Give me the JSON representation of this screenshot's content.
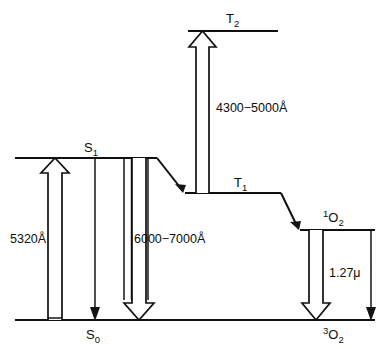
{
  "diagram": {
    "type": "energy-level-diagram",
    "background_color": "#ffffff",
    "line_color": "#101010",
    "levels": [
      {
        "id": "S1",
        "label_main": "S",
        "label_sub": "1",
        "label_sup": "",
        "label_text": "S1",
        "x1": 15,
        "x2": 157,
        "y": 158,
        "label_x": 90,
        "label_y": 151
      },
      {
        "id": "S0",
        "label_main": "S",
        "label_sub": "0",
        "label_sup": "",
        "label_text": "S0",
        "x1": 15,
        "x2": 375,
        "y": 320,
        "label_x": 92,
        "label_y": 337
      },
      {
        "id": "T2",
        "label_main": "T",
        "label_sub": "2",
        "label_sup": "",
        "label_text": "T2",
        "x1": 188,
        "x2": 278,
        "y": 31,
        "label_x": 232,
        "label_y": 22
      },
      {
        "id": "T1",
        "label_main": "T",
        "label_sub": "1",
        "label_sup": "",
        "label_text": "T1",
        "x1": 185,
        "x2": 281,
        "y": 193,
        "label_x": 240,
        "label_y": 186
      },
      {
        "id": "O2-singlet",
        "label_main": "O",
        "label_sub": "2",
        "label_sup": "1",
        "label_text": "1O2",
        "x1": 300,
        "x2": 375,
        "y": 230,
        "label_x": 331,
        "label_y": 221
      },
      {
        "id": "O2-triplet",
        "label_main": "O",
        "label_sub": "2",
        "label_sup": "3",
        "label_text": "3O2",
        "x1": 300,
        "x2": 375,
        "y": 320,
        "label_x": 331,
        "label_y": 338
      }
    ],
    "transitions": [
      {
        "id": "absorption",
        "name": "absorption-5320",
        "style": "hollow-arrow",
        "direction": "up",
        "label": "5320Å",
        "label_x": 10,
        "label_y": 238,
        "from_y": 320,
        "to_y": 158,
        "center_x": 55
      },
      {
        "id": "fluorescence-thin",
        "name": "fluorescence-thin-arrow",
        "style": "thin-arrow",
        "direction": "down",
        "label": "",
        "from_y": 158,
        "to_y": 320,
        "center_x": 95
      },
      {
        "id": "fluorescence",
        "name": "fluorescence-6000-7000",
        "style": "hollow-arrow",
        "direction": "down",
        "label": "6000−7000Å",
        "label_x": 131,
        "label_y": 238,
        "from_y": 158,
        "to_y": 320,
        "center_x": 139
      },
      {
        "id": "triplet-absorption",
        "name": "triplet-absorption-4300-5000",
        "style": "hollow-arrow",
        "direction": "up",
        "label": "4300−5000Å",
        "label_x": 213,
        "label_y": 107,
        "from_y": 193,
        "to_y": 31,
        "center_x": 202.5
      },
      {
        "id": "singlet-oxygen-emission",
        "name": "singlet-oxygen-emission-hollow",
        "style": "hollow-arrow",
        "direction": "down",
        "label": "",
        "from_y": 230,
        "to_y": 320,
        "center_x": 316
      },
      {
        "id": "emission-1-27",
        "name": "oxygen-emission-1-27-micron",
        "style": "thin-arrow",
        "direction": "down",
        "label": "1.27μ",
        "label_x": 326,
        "label_y": 272,
        "from_y": 230,
        "to_y": 320,
        "center_x": 371
      }
    ],
    "relaxations": [
      {
        "id": "isc-s1-t1",
        "name": "intersystem-crossing-s1-t1",
        "x1": 157,
        "y1": 158,
        "x2": 185,
        "y2": 193
      },
      {
        "id": "energy-transfer-t1-o2",
        "name": "energy-transfer-t1-to-oxygen",
        "x1": 281,
        "y1": 193,
        "x2": 300,
        "y2": 230
      }
    ],
    "thin_verticals": [
      {
        "id": "s1-drop-a",
        "x": 124,
        "y1": 158,
        "y2": 320
      },
      {
        "id": "s1-drop-b",
        "x": 131,
        "y1": 158,
        "y2": 320
      },
      {
        "id": "s1-drop-c",
        "x": 148,
        "y1": 158,
        "y2": 320
      },
      {
        "id": "abs-shaft-left",
        "x": 48,
        "y1": 158,
        "y2": 320
      },
      {
        "id": "abs-shaft-right",
        "x": 62,
        "y1": 158,
        "y2": 320
      }
    ],
    "labels": {
      "absorption": "5320Å",
      "fluorescence": "6000−7000Å",
      "triplet_absorption": "4300−5000Å",
      "oxygen_emission": "1.27μ"
    }
  }
}
